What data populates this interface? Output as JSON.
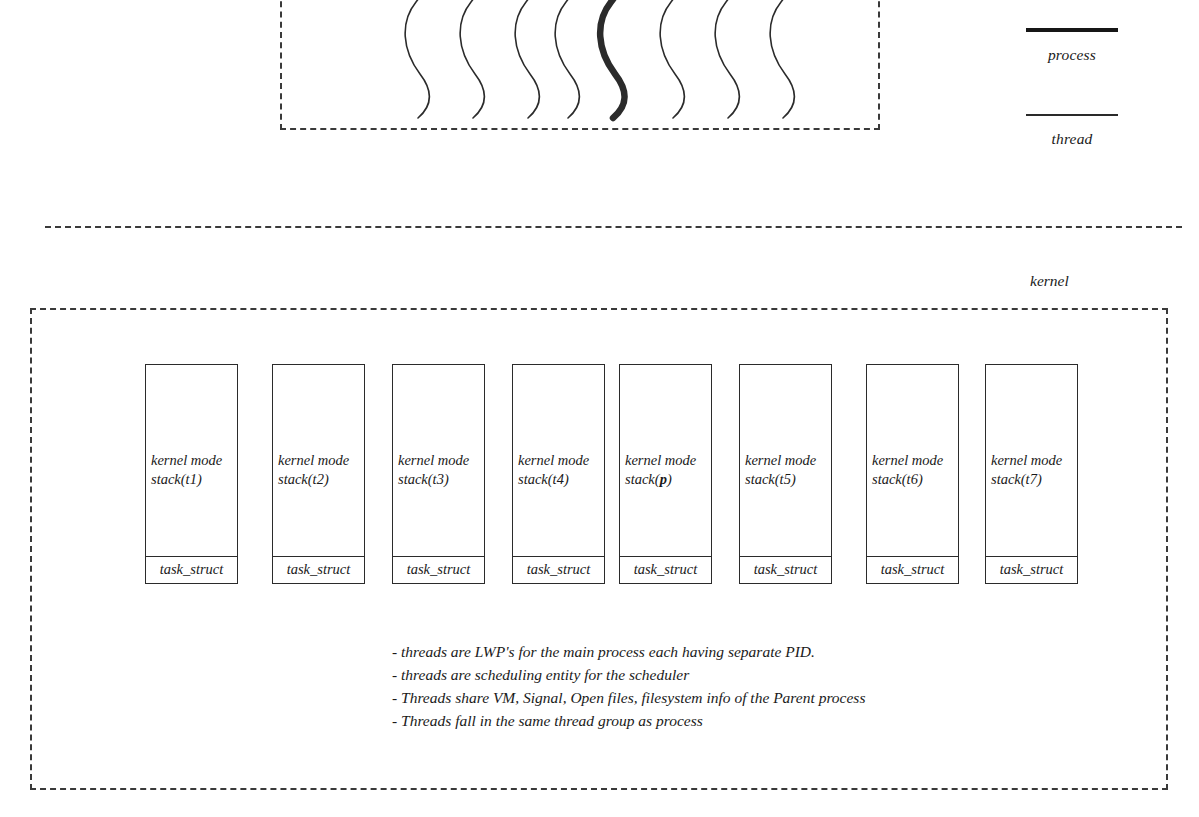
{
  "diagram": {
    "title_region": "linux process and thread kernel representation",
    "user_space": {
      "wave_count": 8,
      "bold_wave_index": 4,
      "wave_meaning_bold": "process",
      "wave_meaning_thin": "thread"
    },
    "legend": {
      "process_label": "process",
      "thread_label": "thread"
    },
    "kernel": {
      "label": "kernel",
      "tasks": [
        {
          "stack_line1": "kernel mode",
          "stack_line2": "stack(t1)",
          "stack_arg": "t1",
          "bold_arg": false,
          "struct_label": "task_struct"
        },
        {
          "stack_line1": "kernel mode",
          "stack_line2": "stack(t2)",
          "stack_arg": "t2",
          "bold_arg": false,
          "struct_label": "task_struct"
        },
        {
          "stack_line1": "kernel mode",
          "stack_line2": "stack(t3)",
          "stack_arg": "t3",
          "bold_arg": false,
          "struct_label": "task_struct"
        },
        {
          "stack_line1": "kernel mode",
          "stack_line2": "stack(t4)",
          "stack_arg": "t4",
          "bold_arg": false,
          "struct_label": "task_struct"
        },
        {
          "stack_line1": "kernel mode",
          "stack_line2": "stack(p)",
          "stack_arg": "p",
          "bold_arg": true,
          "struct_label": "task_struct"
        },
        {
          "stack_line1": "kernel mode",
          "stack_line2": "stack(t5)",
          "stack_arg": "t5",
          "bold_arg": false,
          "struct_label": "task_struct"
        },
        {
          "stack_line1": "kernel mode",
          "stack_line2": "stack(t6)",
          "stack_arg": "t6",
          "bold_arg": false,
          "struct_label": "task_struct"
        },
        {
          "stack_line1": "kernel mode",
          "stack_line2": "stack(t7)",
          "stack_arg": "t7",
          "bold_arg": false,
          "struct_label": "task_struct"
        }
      ],
      "notes": [
        "- threads are LWP's for the main process each having separate PID.",
        "- threads are scheduling entity for the scheduler",
        "- Threads share VM, Signal, Open files, filesystem info of the Parent process",
        "- Threads fall in the same thread group as process"
      ]
    },
    "colors": {
      "ink": "#1a1a1a",
      "line": "#2b2b2b",
      "dash": "#3a3a3a",
      "background": "#ffffff"
    }
  }
}
